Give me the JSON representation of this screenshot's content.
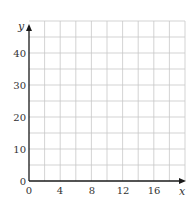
{
  "chart_data": {
    "type": "scatter",
    "title": "",
    "xlabel": "x",
    "ylabel": "y",
    "xlim": [
      0,
      20
    ],
    "ylim": [
      0,
      50
    ],
    "x_ticks": [
      0,
      4,
      8,
      12,
      16
    ],
    "y_ticks": [
      0,
      10,
      20,
      30,
      40
    ],
    "x_grid_step": 2,
    "y_grid_step": 5,
    "grid": true,
    "series": []
  },
  "labels": {
    "x_axis": "x",
    "y_axis": "y",
    "x_ticks": [
      "0",
      "4",
      "8",
      "12",
      "16"
    ],
    "y_ticks": [
      "0",
      "10",
      "20",
      "30",
      "40"
    ]
  }
}
